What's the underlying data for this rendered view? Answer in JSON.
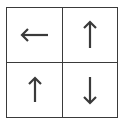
{
  "grid": {
    "rows": 2,
    "cols": 2,
    "cells": [
      {
        "arrow": "left",
        "icon": "arrow-left-icon"
      },
      {
        "arrow": "up",
        "icon": "arrow-up-icon"
      },
      {
        "arrow": "up",
        "icon": "arrow-up-icon"
      },
      {
        "arrow": "down",
        "icon": "arrow-down-icon"
      }
    ]
  },
  "colors": {
    "line": "#3a3a3a",
    "arrow": "#3a3a3a",
    "background": "#ffffff"
  }
}
